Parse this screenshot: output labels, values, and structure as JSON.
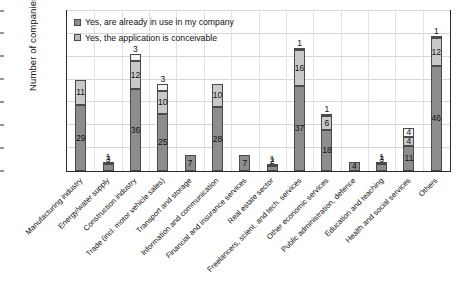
{
  "chart_data": {
    "type": "bar",
    "subtype": "stacked-bar",
    "title": "",
    "xlabel": "",
    "ylabel": "Number of companies",
    "ylim": [
      0,
      70
    ],
    "yticks": [
      0,
      10,
      20,
      30,
      40,
      50,
      60,
      70
    ],
    "grid": true,
    "legend_position": "top-left-inside",
    "categories": [
      "Manufacturing industry",
      "Energy/water supply",
      "Construction industry",
      "Trade (incl. motor vehicle sales)",
      "Transport and storage",
      "Information and communication",
      "Financial and insurance services",
      "Real estate sector",
      "Freelancers, scient. and tech. services",
      "Other economic services",
      "Public administration, defence",
      "Education and teaching",
      "Health and social services",
      "Others"
    ],
    "series": [
      {
        "name": "Yes, are already in use in my company",
        "color": "#8d8d8d",
        "values": [
          29,
          3,
          36,
          25,
          7,
          28,
          7,
          2,
          37,
          18,
          4,
          3,
          11,
          46
        ]
      },
      {
        "name": "Yes, the application is conceivable",
        "color": "#c9c9c9",
        "values": [
          11,
          1,
          12,
          10,
          0,
          10,
          0,
          1,
          16,
          6,
          0,
          1,
          4,
          12
        ]
      },
      {
        "name": "",
        "color": "#f4f4f4",
        "values": [
          0,
          0,
          3,
          3,
          0,
          0,
          0,
          0,
          1,
          1,
          0,
          0,
          4,
          1
        ]
      }
    ],
    "bar_labels": [
      [
        "29",
        "11",
        ""
      ],
      [
        "3",
        "1",
        ""
      ],
      [
        "36",
        "12",
        "3"
      ],
      [
        "25",
        "10",
        "3"
      ],
      [
        "7",
        "",
        ""
      ],
      [
        "28",
        "10",
        ""
      ],
      [
        "7",
        "",
        ""
      ],
      [
        "2",
        "1",
        ""
      ],
      [
        "37",
        "16",
        "1"
      ],
      [
        "18",
        "6",
        "1"
      ],
      [
        "4",
        "",
        ""
      ],
      [
        "3",
        "1",
        ""
      ],
      [
        "11",
        "4",
        "4"
      ],
      [
        "46",
        "12",
        "1"
      ]
    ]
  },
  "legend": {
    "items": [
      {
        "label": "Yes, are already in use in my company",
        "swatch": "series-0-swatch"
      },
      {
        "label": "Yes, the application is conceivable",
        "swatch": "series-1-swatch"
      }
    ]
  },
  "axis": {
    "y_title": "Number of companies"
  }
}
